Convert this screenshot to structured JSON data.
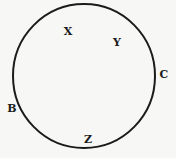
{
  "figure": {
    "type": "geometry-diagram",
    "background_color": "#f7f7f6",
    "stroke_color": "#1b1b1b",
    "stroke_width": 2,
    "width": 176,
    "height": 158,
    "shape": {
      "name": "circle",
      "center_x": 84,
      "center_y": 76,
      "radius_x": 71,
      "radius_y": 72
    },
    "labels": [
      {
        "id": "label-x",
        "text": "X",
        "x": 68,
        "y": 31,
        "position": "inside-upper-left"
      },
      {
        "id": "label-y",
        "text": "Y",
        "x": 117,
        "y": 42,
        "position": "inside-upper-right"
      },
      {
        "id": "label-c",
        "text": "C",
        "x": 164,
        "y": 74,
        "position": "outside-right"
      },
      {
        "id": "label-b",
        "text": "B",
        "x": 12,
        "y": 108,
        "position": "outside-left"
      },
      {
        "id": "label-z",
        "text": "Z",
        "x": 88,
        "y": 139,
        "position": "inside-bottom"
      }
    ]
  }
}
